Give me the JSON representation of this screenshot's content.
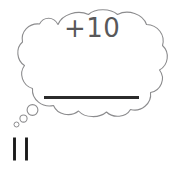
{
  "canvas": {
    "width": 177,
    "height": 174,
    "background_color": "#ffffff"
  },
  "colors": {
    "bubble_outline": "#8c8c8e",
    "expression_text": "#58585a",
    "answer_line": "#2b2b2b",
    "tally_mark": "#1a1a1a"
  },
  "thought_bubble": {
    "name": "thought-bubble",
    "outline_color": "#8c8c8e",
    "fill_color": "#ffffff",
    "stroke_width": 1,
    "expression": {
      "text": "+10",
      "description": "plus ten written inside the thought bubble"
    },
    "answer_blank": {
      "description": "thick horizontal blank line for writing the answer",
      "color": "#2b2b2b"
    }
  },
  "bubble_tail": {
    "name": "thought-bubble-tail",
    "description": "three circles decreasing in size leading from bubble down to the left",
    "circles": [
      {
        "label": "large",
        "cx": 32.5,
        "cy": 110,
        "r": 5.4
      },
      {
        "label": "medium",
        "cx": 23.5,
        "cy": 118.5,
        "r": 3.6
      },
      {
        "label": "small",
        "cx": 16.5,
        "cy": 124.5,
        "r": 2.5
      }
    ]
  },
  "tally_marks": {
    "name": "tally-marks",
    "count": 2,
    "value_label": "11",
    "description": "two thick vertical strokes representing the starting number",
    "marks": [
      {
        "x": 14.5,
        "y_top": 137.5,
        "y_bottom": 160.5
      },
      {
        "x": 26.5,
        "y_top": 137.5,
        "y_bottom": 160.5
      }
    ]
  }
}
